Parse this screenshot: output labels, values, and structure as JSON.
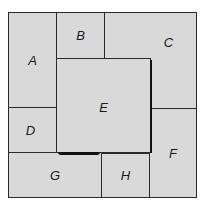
{
  "diagram": {
    "type": "rectangle-dissection-puzzle",
    "pieces": [
      {
        "id": "A",
        "label": "A"
      },
      {
        "id": "B",
        "label": "B"
      },
      {
        "id": "C",
        "label": "C"
      },
      {
        "id": "D",
        "label": "D"
      },
      {
        "id": "E",
        "label": "E"
      },
      {
        "id": "F",
        "label": "F"
      },
      {
        "id": "G",
        "label": "G"
      },
      {
        "id": "H",
        "label": "H"
      }
    ],
    "colors": {
      "fill": "#d9d9d9",
      "border": "#2a2a2a",
      "text": "#1a1a1a"
    }
  }
}
